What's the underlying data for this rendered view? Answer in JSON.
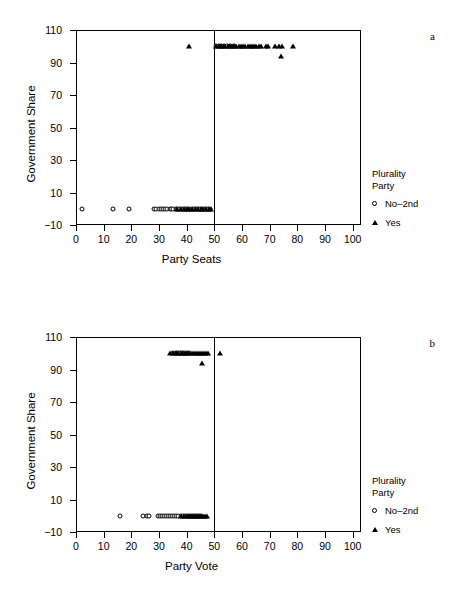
{
  "figure": {
    "panels": [
      {
        "letter": "a",
        "ylabel": "Government Share",
        "xlabel": "Party Seats",
        "legend_title": "Plurality\nParty",
        "legend_items": [
          {
            "label": "No–2nd",
            "marker": "circle"
          },
          {
            "label": "Yes",
            "marker": "triangle"
          }
        ],
        "yticks": [
          -10,
          10,
          30,
          50,
          70,
          90,
          110
        ],
        "xticks": [
          0,
          10,
          20,
          30,
          40,
          50,
          60,
          70,
          80,
          90,
          100
        ]
      },
      {
        "letter": "b",
        "ylabel": "Government Share",
        "xlabel": "Party Vote",
        "legend_title": "Plurality\nParty",
        "legend_items": [
          {
            "label": "No–2nd",
            "marker": "circle"
          },
          {
            "label": "Yes",
            "marker": "triangle"
          }
        ],
        "yticks": [
          -10,
          10,
          30,
          50,
          70,
          90,
          110
        ],
        "xticks": [
          0,
          10,
          20,
          30,
          40,
          50,
          60,
          70,
          80,
          90,
          100
        ]
      }
    ]
  },
  "chart_data": [
    {
      "type": "scatter",
      "title": "",
      "panel_label": "a",
      "xlabel": "Party Seats",
      "ylabel": "Government Share",
      "xlim": [
        0,
        103
      ],
      "ylim": [
        -10,
        110
      ],
      "grid": false,
      "legend_position": "right",
      "legend_title": "Plurality Party",
      "reference_line_x": 50,
      "series": [
        {
          "name": "No-2nd",
          "marker": "open-circle",
          "points": [
            [
              2.0,
              0
            ],
            [
              13.3,
              0
            ],
            [
              19.3,
              0
            ],
            [
              28.3,
              0
            ],
            [
              29.0,
              0
            ],
            [
              30.0,
              0
            ],
            [
              30.8,
              0
            ],
            [
              31.5,
              0
            ],
            [
              32.2,
              0
            ],
            [
              33.0,
              0
            ],
            [
              33.8,
              0
            ],
            [
              34.5,
              0
            ],
            [
              35.2,
              0
            ],
            [
              36.0,
              0
            ],
            [
              36.6,
              0
            ],
            [
              37.3,
              0
            ],
            [
              38.0,
              0
            ],
            [
              38.8,
              0
            ],
            [
              39.5,
              0
            ],
            [
              40.2,
              0
            ],
            [
              41.0,
              0
            ],
            [
              41.8,
              0
            ],
            [
              42.5,
              0
            ],
            [
              43.2,
              0
            ],
            [
              44.0,
              0
            ],
            [
              44.8,
              0
            ],
            [
              45.5,
              0
            ],
            [
              46.2,
              0
            ],
            [
              47.0,
              0
            ],
            [
              47.8,
              0
            ],
            [
              48.5,
              0
            ],
            [
              50.5,
              100
            ],
            [
              51.5,
              100
            ],
            [
              52.5,
              100
            ],
            [
              53.5,
              100
            ],
            [
              54.5,
              100
            ],
            [
              55.5,
              100
            ],
            [
              57.0,
              100
            ]
          ]
        },
        {
          "name": "Yes",
          "marker": "filled-triangle",
          "points": [
            [
              41.0,
              100
            ],
            [
              50.5,
              100
            ],
            [
              51.5,
              100
            ],
            [
              52.5,
              100
            ],
            [
              53.3,
              100
            ],
            [
              54.0,
              100
            ],
            [
              54.8,
              100
            ],
            [
              55.6,
              100
            ],
            [
              56.4,
              100
            ],
            [
              57.2,
              100
            ],
            [
              58.0,
              100
            ],
            [
              58.8,
              100
            ],
            [
              59.6,
              100
            ],
            [
              60.4,
              100
            ],
            [
              61.2,
              100
            ],
            [
              62.0,
              100
            ],
            [
              62.8,
              100
            ],
            [
              63.6,
              100
            ],
            [
              64.4,
              100
            ],
            [
              65.2,
              100
            ],
            [
              66.0,
              100
            ],
            [
              67.0,
              100
            ],
            [
              68.5,
              100
            ],
            [
              69.5,
              100
            ],
            [
              72.0,
              100
            ],
            [
              73.5,
              100
            ],
            [
              74.5,
              100
            ],
            [
              78.5,
              100
            ],
            [
              74.0,
              94
            ],
            [
              36.5,
              0
            ],
            [
              38.0,
              0
            ],
            [
              39.0,
              0
            ],
            [
              40.0,
              0
            ],
            [
              41.0,
              0
            ],
            [
              42.0,
              0
            ],
            [
              43.0,
              0
            ],
            [
              44.0,
              0
            ],
            [
              45.0,
              0
            ],
            [
              46.0,
              0
            ],
            [
              47.0,
              0
            ],
            [
              48.0,
              0
            ],
            [
              48.8,
              0
            ]
          ]
        }
      ]
    },
    {
      "type": "scatter",
      "title": "",
      "panel_label": "b",
      "xlabel": "Party Vote",
      "ylabel": "Government Share",
      "xlim": [
        0,
        103
      ],
      "ylim": [
        -10,
        110
      ],
      "grid": false,
      "legend_position": "right",
      "legend_title": "Plurality Party",
      "reference_line_x": 50,
      "series": [
        {
          "name": "No-2nd",
          "marker": "open-circle",
          "points": [
            [
              15.8,
              0
            ],
            [
              24.2,
              0
            ],
            [
              25.6,
              0
            ],
            [
              26.5,
              0
            ],
            [
              29.5,
              0
            ],
            [
              30.3,
              0
            ],
            [
              31.0,
              0
            ],
            [
              31.8,
              0
            ],
            [
              32.5,
              0
            ],
            [
              33.3,
              0
            ],
            [
              34.0,
              0
            ],
            [
              34.8,
              0
            ],
            [
              35.5,
              0
            ],
            [
              36.3,
              0
            ],
            [
              37.0,
              0
            ],
            [
              37.8,
              0
            ],
            [
              38.5,
              0
            ],
            [
              39.3,
              0
            ],
            [
              40.0,
              0
            ],
            [
              40.8,
              0
            ],
            [
              41.5,
              0
            ],
            [
              42.3,
              0
            ],
            [
              43.0,
              0
            ],
            [
              43.8,
              0
            ],
            [
              44.5,
              0
            ],
            [
              45.3,
              0
            ],
            [
              35.0,
              100
            ],
            [
              36.0,
              100
            ],
            [
              36.8,
              100
            ],
            [
              37.5,
              100
            ],
            [
              38.2,
              100
            ],
            [
              39.0,
              100
            ],
            [
              40.0,
              100
            ],
            [
              41.0,
              100
            ]
          ]
        },
        {
          "name": "Yes",
          "marker": "filled-triangle",
          "points": [
            [
              34.0,
              100
            ],
            [
              35.0,
              100
            ],
            [
              36.0,
              100
            ],
            [
              37.0,
              100
            ],
            [
              38.0,
              100
            ],
            [
              38.8,
              100
            ],
            [
              39.5,
              100
            ],
            [
              40.2,
              100
            ],
            [
              41.0,
              100
            ],
            [
              41.8,
              100
            ],
            [
              42.5,
              100
            ],
            [
              43.2,
              100
            ],
            [
              44.0,
              100
            ],
            [
              44.8,
              100
            ],
            [
              45.5,
              100
            ],
            [
              46.2,
              100
            ],
            [
              47.0,
              100
            ],
            [
              47.8,
              100
            ],
            [
              52.0,
              100
            ],
            [
              45.5,
              94
            ],
            [
              38.0,
              0
            ],
            [
              39.0,
              0
            ],
            [
              40.0,
              0
            ],
            [
              40.8,
              0
            ],
            [
              41.5,
              0
            ],
            [
              42.2,
              0
            ],
            [
              43.0,
              0
            ],
            [
              43.8,
              0
            ],
            [
              44.5,
              0
            ],
            [
              45.2,
              0
            ],
            [
              46.0,
              0
            ],
            [
              46.8,
              0
            ],
            [
              47.5,
              0
            ]
          ]
        }
      ]
    }
  ]
}
